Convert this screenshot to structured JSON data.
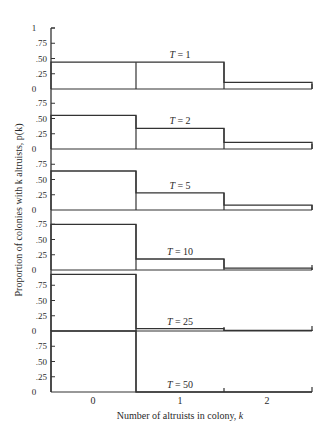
{
  "chart_data": {
    "type": "bar",
    "subtype": "stacked-panel step histograms",
    "title": "",
    "xlabel": "Number of altruists in colony, k",
    "ylabel": "Proportion of colonies with k altruists, p(k)",
    "categories": [
      "0",
      "1",
      "2"
    ],
    "y_ticks": [
      "0",
      ".25",
      ".50",
      ".75",
      "1"
    ],
    "ylim": [
      0,
      1
    ],
    "grid": false,
    "legend": "none",
    "panels": [
      {
        "label": "T = 1",
        "values": [
          0.44,
          0.44,
          0.11
        ]
      },
      {
        "label": "T = 2",
        "values": [
          0.55,
          0.34,
          0.11
        ]
      },
      {
        "label": "T = 5",
        "values": [
          0.64,
          0.28,
          0.08
        ]
      },
      {
        "label": "T = 10",
        "values": [
          0.75,
          0.18,
          0.03
        ]
      },
      {
        "label": "T = 25",
        "values": [
          0.93,
          0.04,
          0.01
        ]
      },
      {
        "label": "T = 50",
        "values": [
          1.0,
          0.0,
          0.0
        ]
      }
    ],
    "series": [
      {
        "name": "T = 1",
        "values": [
          0.44,
          0.44,
          0.11
        ]
      },
      {
        "name": "T = 2",
        "values": [
          0.55,
          0.34,
          0.11
        ]
      },
      {
        "name": "T = 5",
        "values": [
          0.64,
          0.28,
          0.08
        ]
      },
      {
        "name": "T = 10",
        "values": [
          0.75,
          0.18,
          0.03
        ]
      },
      {
        "name": "T = 25",
        "values": [
          0.93,
          0.04,
          0.01
        ]
      },
      {
        "name": "T = 50",
        "values": [
          1.0,
          0.0,
          0.0
        ]
      }
    ]
  }
}
